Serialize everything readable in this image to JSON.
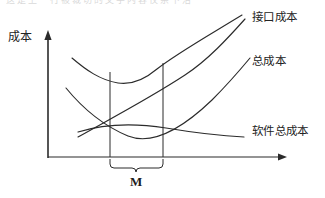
{
  "figure": {
    "page_top_partial_text": "这是上一行被裁切的文字内容仅余下沿",
    "background_color": "#ffffff",
    "stroke_color": "#2b2b2b",
    "axes": {
      "y_axis_label": "成本",
      "y_axis": {
        "x": 48,
        "y_top": 32,
        "y_bottom": 158
      },
      "x_axis": {
        "y": 157,
        "x_left": 48,
        "x_right": 286
      }
    },
    "curves": [
      {
        "name": "interface-cost",
        "label": "接口成本",
        "shape": "rising-line",
        "points": [
          [
            78,
            137
          ],
          [
            120,
            112
          ],
          [
            160,
            87
          ],
          [
            200,
            58
          ],
          [
            245,
            19
          ]
        ]
      },
      {
        "name": "total-cost",
        "label": "总成本",
        "shape": "u-curve",
        "points": [
          [
            72,
            58
          ],
          [
            95,
            73
          ],
          [
            120,
            82
          ],
          [
            140,
            83
          ],
          [
            163,
            64
          ],
          [
            200,
            80
          ],
          [
            250,
            58
          ]
        ]
      },
      {
        "name": "software-total-cost",
        "label": "软件总成本",
        "shape": "decaying-curve",
        "points": [
          [
            78,
            132
          ],
          [
            120,
            126
          ],
          [
            170,
            130
          ],
          [
            210,
            135
          ],
          [
            244,
            137
          ]
        ]
      }
    ],
    "band": {
      "name": "optimum-region",
      "label": "M",
      "x_left": 110,
      "x_right": 163,
      "y_top_left": 72,
      "y_top_right": 63,
      "y_bottom": 157,
      "brace_center_x": 136,
      "brace_bottom_y": 172
    }
  },
  "labels": {
    "y_axis": "成本",
    "interface_cost": "接口成本",
    "total_cost": "总成本",
    "software_total_cost": "软件总成本",
    "band_marker": "M"
  }
}
